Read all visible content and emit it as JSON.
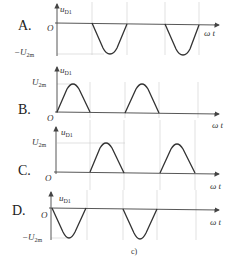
{
  "figure": {
    "caption": "c)",
    "y_label_main": "u",
    "y_label_sub": "D1",
    "x_label": "ω t",
    "origin_label": "O",
    "amp_pos_label_main": "U",
    "amp_pos_label_sub": "2m",
    "amp_neg_label_main": "−U",
    "amp_neg_label_sub": "2m"
  },
  "options": [
    {
      "label": "A.",
      "polarity": "negative",
      "shape": "half-wave troughs in 2nd and 4th half-periods"
    },
    {
      "label": "B.",
      "polarity": "positive",
      "shape": "half-wave humps in 1st and 3rd half-periods"
    },
    {
      "label": "C.",
      "polarity": "positive",
      "shape": "half-wave humps in 2nd and 4th half-periods"
    },
    {
      "label": "D.",
      "polarity": "negative",
      "shape": "half-wave troughs in 1st and 3rd half-periods"
    }
  ]
}
